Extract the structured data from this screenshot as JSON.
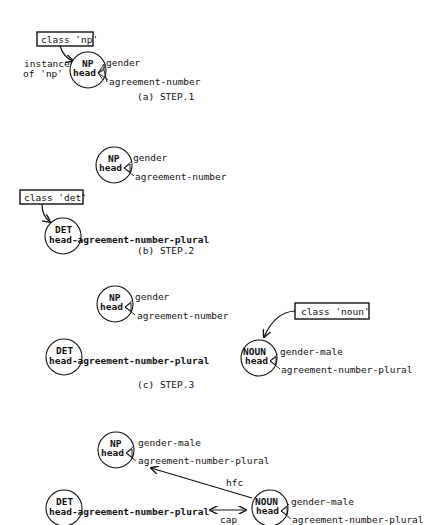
{
  "colors": {
    "ink": "#111111",
    "background": "#ffffff"
  },
  "steps": [
    {
      "caption": "(a) STEP.1",
      "class_box": "class 'np'",
      "instance_label_line1": "instance",
      "instance_label_line2": "of 'np'",
      "np": {
        "category": "NP",
        "slot": "head",
        "features": [
          "gender",
          "agreement-number"
        ]
      }
    },
    {
      "caption": "(b) STEP.2",
      "class_box": "class 'det'",
      "np": {
        "category": "NP",
        "slot": "head",
        "features": [
          "gender",
          "agreement-number"
        ]
      },
      "det": {
        "category": "DET",
        "slot_text": "head-agreement-number-plural"
      }
    },
    {
      "caption": "(c) STEP.3",
      "class_box": "class 'noun'",
      "np": {
        "category": "NP",
        "slot": "head",
        "features": [
          "gender",
          "agreement-number"
        ]
      },
      "det": {
        "category": "DET",
        "slot_text": "head-agreement-number-plural"
      },
      "noun": {
        "category": "NOUN",
        "slot": "head",
        "features": [
          "gender-male",
          "agreement-number-plural"
        ]
      }
    },
    {
      "np": {
        "category": "NP",
        "slot": "head",
        "features": [
          "gender-male",
          "agreement-number-plural"
        ]
      },
      "det": {
        "category": "DET",
        "slot_text": "head-agreement-number-plural"
      },
      "noun": {
        "category": "NOUN",
        "slot": "head",
        "features": [
          "gender-male",
          "agreement-number-plural"
        ]
      },
      "edge_hfc": "hfc",
      "edge_cap": "cap"
    }
  ]
}
